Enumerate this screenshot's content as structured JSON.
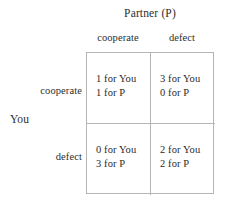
{
  "figure": {
    "kind": "payoff-matrix",
    "column_player_label": "Partner (P)",
    "row_player_label": "You",
    "column_headers": [
      "cooperate",
      "defect"
    ],
    "row_headers": [
      "cooperate",
      "defect"
    ],
    "border_color": "#b5b5b5",
    "text_color": "#2b2b2b",
    "background_color": "#ffffff"
  },
  "cells": {
    "r0c0": {
      "you": "1 for You",
      "partner": "1 for P"
    },
    "r0c1": {
      "you": "3 for You",
      "partner": "0 for P"
    },
    "r1c0": {
      "you": "0 for You",
      "partner": "3 for P"
    },
    "r1c1": {
      "you": "2 for You",
      "partner": "2 for P"
    }
  },
  "chart_data": {
    "type": "table",
    "title": "",
    "row_player": "You",
    "column_player": "Partner (P)",
    "categories": [
      "cooperate",
      "defect"
    ],
    "rows": [
      "cooperate",
      "defect"
    ],
    "columns": [
      "cooperate",
      "defect"
    ],
    "payoffs": [
      [
        {
          "you": 1,
          "partner": 1
        },
        {
          "you": 3,
          "partner": 0
        }
      ],
      [
        {
          "you": 0,
          "partner": 3
        },
        {
          "you": 2,
          "partner": 2
        }
      ]
    ],
    "cell_text": [
      [
        "1 for You\n1 for P",
        "3 for You\n0 for P"
      ],
      [
        "0 for You\n3 for P",
        "2 for You\n2 for P"
      ]
    ],
    "grid": true,
    "legend": "none"
  }
}
